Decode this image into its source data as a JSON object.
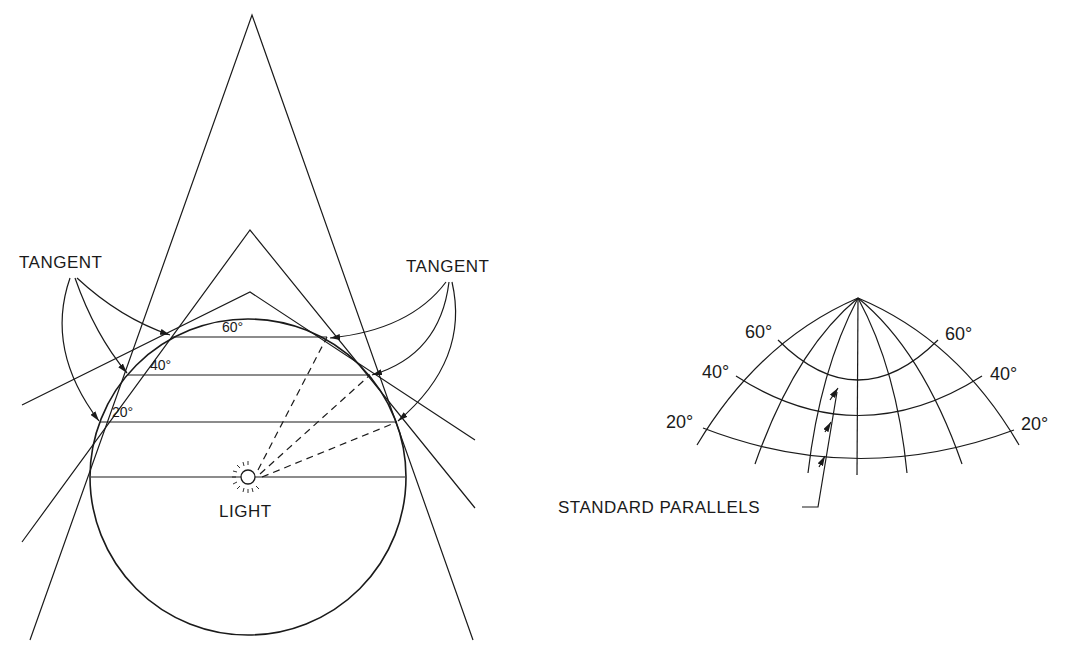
{
  "left_figure": {
    "tangent_left_label": "TANGENT",
    "tangent_right_label": "TANGENT",
    "parallel_labels": {
      "p60": "60°",
      "p40": "40°",
      "p20": "20°"
    },
    "light_label": "LIGHT"
  },
  "right_figure": {
    "left_labels": {
      "p60": "60°",
      "p40": "40°",
      "p20": "20°"
    },
    "right_labels": {
      "p60": "60°",
      "p40": "40°",
      "p20": "20°"
    },
    "callout_label": "STANDARD PARALLELS"
  },
  "colors": {
    "ink": "#1a1a1a",
    "background": "#ffffff"
  }
}
